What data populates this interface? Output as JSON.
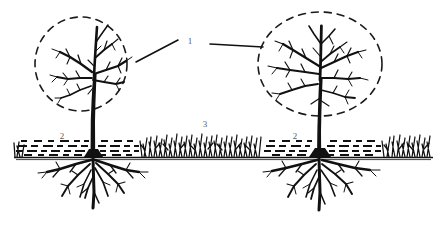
{
  "figure": {
    "type": "botanical-orchard-diagram",
    "background_color": "#ffffff",
    "ink_color": "#111111",
    "label_color": "#5a5a5a",
    "ground_line_color": "#111111"
  },
  "labels": [
    {
      "id": "1",
      "text": "1",
      "meaning": "tree-crown-projection-outline",
      "x": 190,
      "y": 41
    },
    {
      "id": "2-left",
      "text": "2",
      "meaning": "mulched-soil-strip",
      "x": 62,
      "y": 136
    },
    {
      "id": "3",
      "text": "3",
      "meaning": "grass-sod-strip",
      "x": 205,
      "y": 124
    },
    {
      "id": "2-right",
      "text": "2",
      "meaning": "mulched-soil-strip",
      "x": 295,
      "y": 136
    }
  ],
  "leader_lines": [
    {
      "name": "leader-to-left-crown",
      "x1": 178,
      "y1": 40,
      "x2": 136,
      "y2": 62
    },
    {
      "name": "leader-to-right-crown",
      "x1": 210,
      "y1": 44,
      "x2": 263,
      "y2": 47
    }
  ],
  "trees": [
    {
      "name": "left-tree",
      "trunk_x": 93,
      "ground_y": 157,
      "canopy": {
        "cx": 81,
        "cy": 64,
        "rx": 46,
        "ry": 47,
        "style": "dashed"
      },
      "crown_top_y": 18
    },
    {
      "name": "right-tree",
      "trunk_x": 320,
      "ground_y": 157,
      "canopy": {
        "cx": 320,
        "cy": 64,
        "rx": 62,
        "ry": 52,
        "style": "dashed"
      },
      "crown_top_y": 12
    }
  ],
  "ground": {
    "band_left": 14,
    "band_right": 432,
    "band_top": 141,
    "band_bottom": 157,
    "line_y": 157,
    "segments": [
      {
        "type": "mulch",
        "label_ref": "2-left",
        "x1": 14,
        "x2": 140
      },
      {
        "type": "grass",
        "label_ref": "3",
        "x1": 140,
        "x2": 262
      },
      {
        "type": "mulch",
        "label_ref": "2-right",
        "x1": 262,
        "x2": 382
      },
      {
        "type": "grass",
        "label_ref": "3",
        "x1": 382,
        "x2": 432
      }
    ]
  }
}
